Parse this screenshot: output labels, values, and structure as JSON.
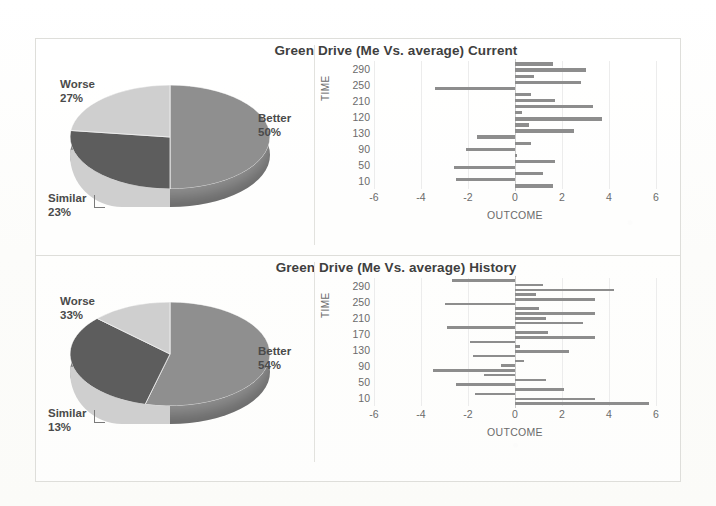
{
  "figure": {
    "background_color": "#fdfdfb",
    "frame_color": "#dededa"
  },
  "panels": [
    {
      "id": "current",
      "title": "Green Drive (Me Vs. average) Current",
      "pie": {
        "type": "pie",
        "title": "Green Drive (Me Vs. average) Current",
        "labels": [
          "Better",
          "Worse",
          "Similar"
        ],
        "values": [
          50,
          27,
          23
        ],
        "value_labels": [
          "50%",
          "27%",
          "23%"
        ],
        "colors": [
          "#8f8f8f",
          "#5d5d5d",
          "#cfcfcf"
        ],
        "legend": "labels-outside",
        "style": "3d-exploded-none"
      },
      "bar": {
        "type": "bar",
        "orientation": "horizontal",
        "xlabel": "OUTCOME",
        "ylabel": "TIME",
        "xlim": [
          -6,
          6
        ],
        "xticks": [
          -6,
          -4,
          -2,
          0,
          2,
          4,
          6
        ],
        "xtick_labels": [
          "-6",
          "-4",
          "-2",
          "0",
          "2",
          "4",
          "6"
        ],
        "ytick_labels": [
          "290",
          "250",
          "210",
          "120",
          "130",
          "90",
          "50",
          "10"
        ],
        "grid": true,
        "bar_color": "#8d8d8d",
        "values": [
          1.6,
          3.0,
          0.8,
          2.8,
          -3.4,
          0.7,
          1.7,
          3.3,
          0.3,
          3.7,
          0.6,
          2.5,
          -1.6,
          0.7,
          -2.1,
          0.1,
          1.7,
          -2.6,
          1.2,
          -2.5,
          1.6
        ]
      }
    },
    {
      "id": "history",
      "title": "Green Drive (Me Vs. average) History",
      "pie": {
        "type": "pie",
        "title": "Green Drive (Me Vs. average) History",
        "labels": [
          "Better",
          "Worse",
          "Similar"
        ],
        "values": [
          54,
          33,
          13
        ],
        "value_labels": [
          "54%",
          "33%",
          "13%"
        ],
        "colors": [
          "#8f8f8f",
          "#5d5d5d",
          "#cfcfcf"
        ],
        "legend": "labels-outside",
        "style": "3d-exploded-none"
      },
      "bar": {
        "type": "bar",
        "orientation": "horizontal",
        "xlabel": "OUTCOME",
        "ylabel": "TIME",
        "xlim": [
          -6,
          6
        ],
        "xticks": [
          -6,
          -4,
          -2,
          0,
          2,
          4,
          6
        ],
        "xtick_labels": [
          "-6",
          "-4",
          "-2",
          "0",
          "2",
          "4",
          "6"
        ],
        "ytick_labels": [
          "290",
          "250",
          "210",
          "170",
          "130",
          "90",
          "50",
          "10"
        ],
        "grid": true,
        "bar_color": "#8d8d8d",
        "values": [
          -2.7,
          1.2,
          4.2,
          0.9,
          3.4,
          -3.0,
          1.0,
          3.4,
          1.3,
          2.9,
          -2.9,
          1.4,
          3.4,
          -1.9,
          0.2,
          2.3,
          -1.8,
          0.4,
          -0.6,
          -3.5,
          -1.3,
          1.3,
          -2.5,
          2.1,
          -1.7,
          3.4,
          5.7
        ]
      }
    }
  ],
  "chart_data": [
    {
      "type": "pie",
      "title": "Green Drive (Me Vs. average) Current",
      "categories": [
        "Better",
        "Worse",
        "Similar"
      ],
      "values": [
        50,
        27,
        23
      ],
      "unit": "percent",
      "legend": "outside-labels",
      "xlabel": "",
      "ylabel": ""
    },
    {
      "type": "bar",
      "title": "Green Drive (Me Vs. average) Current",
      "orientation": "horizontal",
      "xlabel": "OUTCOME",
      "ylabel": "TIME",
      "xlim": [
        -6,
        6
      ],
      "categories": [
        "290",
        "250",
        "210",
        "120",
        "130",
        "90",
        "50",
        "10"
      ],
      "values": [
        1.6,
        3.0,
        0.8,
        2.8,
        -3.4,
        0.7,
        1.7,
        3.3,
        0.3,
        3.7,
        0.6,
        2.5,
        -1.6,
        0.7,
        -2.1,
        0.1,
        1.7,
        -2.6,
        1.2,
        -2.5,
        1.6
      ],
      "grid": true
    },
    {
      "type": "pie",
      "title": "Green Drive (Me Vs. average) History",
      "categories": [
        "Better",
        "Worse",
        "Similar"
      ],
      "values": [
        54,
        33,
        13
      ],
      "unit": "percent",
      "legend": "outside-labels",
      "xlabel": "",
      "ylabel": ""
    },
    {
      "type": "bar",
      "title": "Green Drive (Me Vs. average) History",
      "orientation": "horizontal",
      "xlabel": "OUTCOME",
      "ylabel": "TIME",
      "xlim": [
        -6,
        6
      ],
      "categories": [
        "290",
        "250",
        "210",
        "170",
        "130",
        "90",
        "50",
        "10"
      ],
      "values": [
        -2.7,
        1.2,
        4.2,
        0.9,
        3.4,
        -3.0,
        1.0,
        3.4,
        1.3,
        2.9,
        -2.9,
        1.4,
        3.4,
        -1.9,
        0.2,
        2.3,
        -1.8,
        0.4,
        -0.6,
        -3.5,
        -1.3,
        1.3,
        -2.5,
        2.1,
        -1.7,
        3.4,
        5.7
      ],
      "grid": true
    }
  ]
}
